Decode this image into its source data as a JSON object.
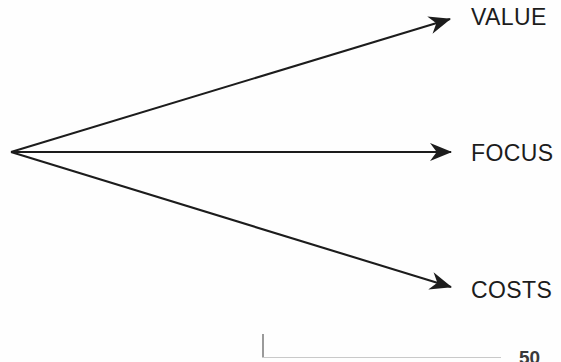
{
  "figure": {
    "type": "diagram",
    "subtype": "radiating-arrow-fan",
    "background_color": "#fefefe",
    "stroke_color": "#1c1c1c",
    "origin": {
      "x": 11,
      "y": 152
    },
    "branches": [
      {
        "id": "value",
        "label": "VALUE",
        "direction": "up-right",
        "arrow_tip": {
          "x": 462,
          "y": 17
        },
        "label_position": {
          "x": 471,
          "y": 6
        }
      },
      {
        "id": "focus",
        "label": "FOCUS",
        "direction": "right",
        "arrow_tip": {
          "x": 463,
          "y": 152
        },
        "label_position": {
          "x": 471,
          "y": 142
        }
      },
      {
        "id": "costs",
        "label": "COSTS",
        "direction": "down-right",
        "arrow_tip": {
          "x": 463,
          "y": 290
        },
        "label_position": {
          "x": 471,
          "y": 279
        }
      }
    ]
  },
  "footnote": {
    "rule_color": "#c9c9c9",
    "tick_color": "#9a9a9a",
    "clipped_text": "50"
  }
}
